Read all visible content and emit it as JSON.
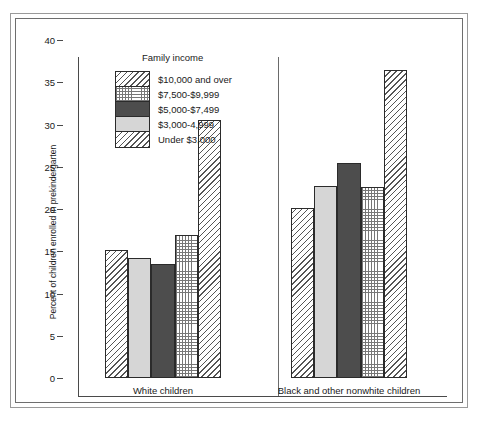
{
  "chart_data": {
    "type": "bar",
    "title": "",
    "xlabel": "",
    "ylabel": "Percent of children enrolled in prekindergarten",
    "ylim": [
      0,
      40
    ],
    "ytick_values": [
      40,
      35,
      30,
      25,
      20,
      15,
      10,
      5,
      0
    ],
    "ytick_labels": [
      "40",
      "35",
      "30",
      "25",
      "20",
      "15",
      "10",
      "5",
      "0"
    ],
    "grid": false,
    "legend_title": "Family income",
    "legend_position": "upper-left-inside",
    "categories": [
      "White children",
      "Black and other nonwhite children"
    ],
    "series": [
      {
        "name": "$10,000 and over",
        "pattern": "diagonal-hatch",
        "values": [
          15.2,
          20.1
        ]
      },
      {
        "name": "$3,000-4,999",
        "pattern": "light-solid",
        "values": [
          14.2,
          22.7
        ]
      },
      {
        "name": "$5,000-$7,499",
        "pattern": "dark-solid",
        "values": [
          13.5,
          25.5
        ]
      },
      {
        "name": "$7,500-$9,999",
        "pattern": "fine-grid",
        "values": [
          16.9,
          22.6
        ]
      },
      {
        "name": "Under $3,000",
        "pattern": "diagonal-hatch",
        "values": [
          30.5,
          36.4
        ]
      }
    ],
    "legend_entries": [
      {
        "label": "$10,000 and over",
        "pattern": "diagonal-hatch"
      },
      {
        "label": "$7,500-$9,999",
        "pattern": "fine-grid"
      },
      {
        "label": "$5,000-$7,499",
        "pattern": "dark-solid"
      },
      {
        "label": "$3,000-4,999",
        "pattern": "light-solid"
      },
      {
        "label": "Under $3,000",
        "pattern": "diagonal-hatch"
      }
    ],
    "colors": {
      "dark_fill": "#4d4d4d",
      "light_fill": "#d6d6d6",
      "hatch_line": "#555555",
      "grid_line": "#777777",
      "bar_outline": "#2b2b2b",
      "axis": "#4a4a4a",
      "text": "#1a1a1a",
      "background": "#ffffff"
    }
  }
}
